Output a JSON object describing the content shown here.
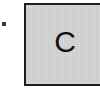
{
  "diagram": {
    "bullet": {
      "symbol": "•",
      "color": "#3a3a3a"
    },
    "box": {
      "label": "C",
      "fill_color": "#d4d4d4",
      "border_color": "#1e1e1e"
    }
  }
}
